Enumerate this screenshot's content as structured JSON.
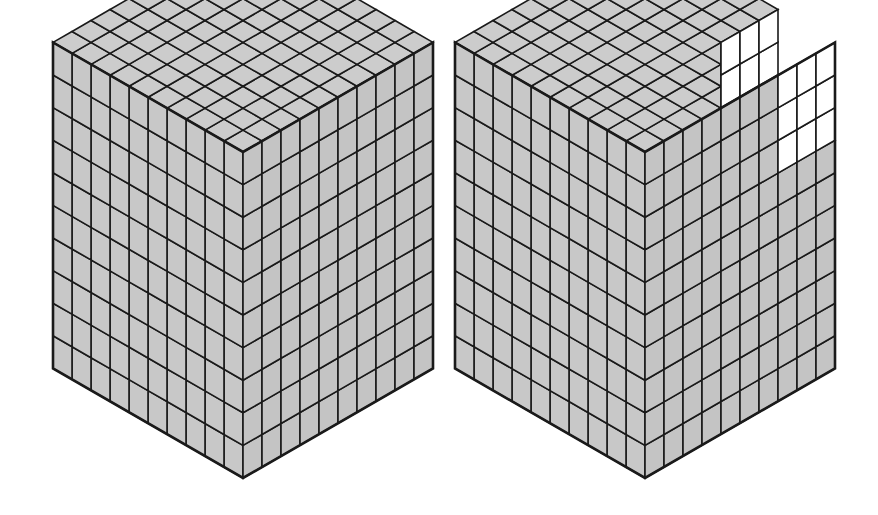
{
  "figure": {
    "title": "Two isometric unit-cube blocks, one complete and one with a corner block removed",
    "background_color": "#ffffff",
    "canvas": {
      "width": 878,
      "height": 515
    }
  },
  "style": {
    "shaded_fill": "#c8c8c8",
    "unshaded_fill": "#ffffff",
    "edge_color": "#1a1a1a",
    "outline_color": "#1a1a1a",
    "grid_stroke_width": 1.6,
    "outline_stroke_width": 2.6,
    "top_face_tint": "#cccccc",
    "left_face_tint": "#c8c8c8",
    "right_face_tint": "#c4c4c4"
  },
  "projection": {
    "type": "isometric",
    "unit_x": 19.0,
    "unit_y": 10.96,
    "unit_z": 32.6,
    "description": "screen = origin + i*(+ux,+uy) + j*(-ux,+uy) + k*(0,-uz)"
  },
  "cubes": [
    {
      "id": "cube-left",
      "label": "Complete 10 by 10 by 10 cube",
      "dimensions": {
        "width": 10,
        "depth": 10,
        "height": 10
      },
      "total_unit_cubes": 1000,
      "origin": {
        "x": 243,
        "y": 478
      },
      "removed_block": null,
      "shaded": true,
      "vertices": {
        "left": {
          "x": 53,
          "y": 367
        },
        "top": {
          "x": 243,
          "y": 38
        },
        "right": {
          "x": 433,
          "y": 367
        },
        "bottom": {
          "x": 243,
          "y": 478
        }
      }
    },
    {
      "id": "cube-right",
      "label": "10 by 10 by 10 cube with a 3 by 3 by 3 corner block removed",
      "dimensions": {
        "width": 10,
        "depth": 10,
        "height": 10
      },
      "total_unit_cubes": 1000,
      "origin": {
        "x": 645,
        "y": 478
      },
      "removed_block": {
        "label": "removed corner block",
        "size": {
          "width": 3,
          "depth": 3,
          "height": 3
        },
        "count": 27,
        "corner": "top-back-right",
        "shaded": false
      },
      "remaining_unit_cubes": 973,
      "shaded": true,
      "vertices": {
        "left": {
          "x": 455,
          "y": 367
        },
        "top": {
          "x": 645,
          "y": 38
        },
        "right": {
          "x": 835,
          "y": 367
        },
        "bottom": {
          "x": 645,
          "y": 478
        }
      }
    }
  ],
  "chart_data": {
    "type": "diagram",
    "items": [
      {
        "name": "left cube",
        "edge_units": 10,
        "unit_cubes": 1000,
        "shaded_all": true
      },
      {
        "name": "right cube",
        "edge_units": 10,
        "unit_cubes": 1000,
        "removed": 27,
        "remaining": 973
      }
    ]
  }
}
